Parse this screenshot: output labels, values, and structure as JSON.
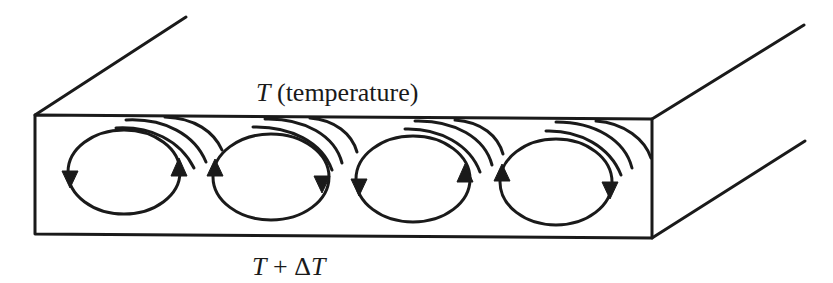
{
  "figure": {
    "top_label": {
      "symbol": "T",
      "text": "(temperature)"
    },
    "bottom_label": {
      "symbol_a": "T",
      "operator": "+",
      "delta": "Δ",
      "symbol_b": "T"
    },
    "cells": [
      {
        "index": 1,
        "rotation": "clockwise",
        "left_arrow": "down",
        "right_arrow": "up"
      },
      {
        "index": 2,
        "rotation": "counterclockwise",
        "left_arrow": "up",
        "right_arrow": "down"
      },
      {
        "index": 3,
        "rotation": "clockwise",
        "left_arrow": "down",
        "right_arrow": "up"
      },
      {
        "index": 4,
        "rotation": "counterclockwise",
        "left_arrow": "up",
        "right_arrow": "down"
      }
    ],
    "colors": {
      "ink": "#1a1a1a",
      "background": "#ffffff"
    }
  }
}
